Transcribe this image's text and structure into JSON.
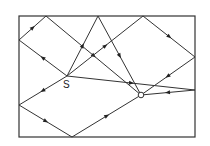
{
  "diagram": {
    "frame": {
      "x1": 19,
      "y1": 16,
      "x2": 195,
      "y2": 137
    },
    "points": {
      "S": {
        "x": 67,
        "y": 76,
        "label": "S"
      },
      "O": {
        "x": 141,
        "y": 95,
        "label": "O"
      }
    },
    "paths": [
      {
        "name": "left-top-reflection",
        "points": [
          [
            67,
            76
          ],
          [
            19,
            40
          ],
          [
            46,
            16
          ],
          [
            141,
            95
          ]
        ]
      },
      {
        "name": "top-direct-reflection",
        "points": [
          [
            67,
            76
          ],
          [
            98,
            16
          ],
          [
            141,
            95
          ]
        ]
      },
      {
        "name": "top-right-reflection",
        "points": [
          [
            67,
            76
          ],
          [
            143,
            16
          ],
          [
            195,
            57
          ],
          [
            141,
            95
          ]
        ]
      },
      {
        "name": "right-reflection",
        "points": [
          [
            67,
            76
          ],
          [
            195,
            90
          ],
          [
            141,
            95
          ]
        ]
      },
      {
        "name": "left-bottom-reflection",
        "points": [
          [
            67,
            76
          ],
          [
            19,
            105
          ],
          [
            72,
            137
          ],
          [
            141,
            95
          ]
        ]
      }
    ],
    "labels": {
      "source": "S",
      "observer": "O"
    }
  }
}
